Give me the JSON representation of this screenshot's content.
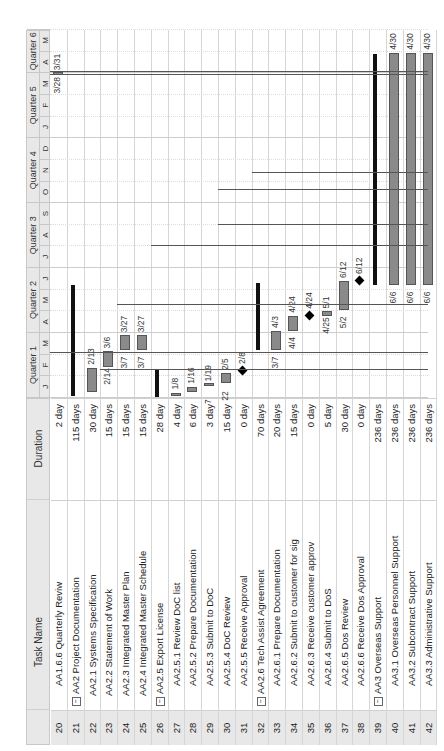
{
  "columns": {
    "id": "",
    "name": "Task Name",
    "duration": "Duration"
  },
  "timescale": {
    "quarters": [
      "Quarter 1",
      "Quarter 2",
      "Quarter 3",
      "Quarter 4",
      "Quarter 5",
      "Quarter 6"
    ],
    "months": [
      "J",
      "F",
      "M",
      "A",
      "M",
      "J",
      "J",
      "A",
      "S",
      "O",
      "N",
      "D",
      "J",
      "F",
      "M",
      "A",
      "M"
    ]
  },
  "tasks": [
    {
      "id": "20",
      "name": "AA1.6.6 Quarterly Reviw",
      "duration": "2 day",
      "indent": 2,
      "collapsible": false
    },
    {
      "id": "21",
      "name": "AA2 Project Documentation",
      "duration": "115 days",
      "indent": 0,
      "collapsible": true
    },
    {
      "id": "22",
      "name": "AA2.1 Systems Specification",
      "duration": "30 day",
      "indent": 1,
      "collapsible": false
    },
    {
      "id": "23",
      "name": "AA2.2 Statement of Work",
      "duration": "15 days",
      "indent": 1,
      "collapsible": false
    },
    {
      "id": "24",
      "name": "AA2.3 Integrated Master Plan",
      "duration": "15 days",
      "indent": 1,
      "collapsible": false
    },
    {
      "id": "25",
      "name": "AA2.4 Integrated Master Schedule",
      "duration": "15 days",
      "indent": 1,
      "collapsible": false
    },
    {
      "id": "26",
      "name": "AA2.5 Export License",
      "duration": "28 day",
      "indent": 0,
      "collapsible": true
    },
    {
      "id": "27",
      "name": "AA2.5.1 Review DoC list",
      "duration": "4 day",
      "indent": 2,
      "collapsible": false
    },
    {
      "id": "28",
      "name": "AA2.5.2 Prepare Documentation",
      "duration": "6 day",
      "indent": 2,
      "collapsible": false
    },
    {
      "id": "29",
      "name": "AA2.5.3 Submit to DoC",
      "duration": "3 day",
      "indent": 2,
      "collapsible": false
    },
    {
      "id": "30",
      "name": "AA2.5.4 DoC Review",
      "duration": "15 day",
      "indent": 2,
      "collapsible": false
    },
    {
      "id": "31",
      "name": "AA2.5.5 Receive Approval",
      "duration": "0 day",
      "indent": 2,
      "collapsible": false
    },
    {
      "id": "32",
      "name": "AA2.6 Tech Assist Agreement",
      "duration": "70 days",
      "indent": 0,
      "collapsible": true
    },
    {
      "id": "33",
      "name": "AA2.6.1 Prepare Documentation",
      "duration": "20 days",
      "indent": 2,
      "collapsible": false
    },
    {
      "id": "34",
      "name": "AA2.6.2 Submit to customer for sig",
      "duration": "15 days",
      "indent": 2,
      "collapsible": false
    },
    {
      "id": "35",
      "name": "AA2.6.3 Receive customer approv",
      "duration": "0 day",
      "indent": 2,
      "collapsible": false
    },
    {
      "id": "36",
      "name": "AA2.6.4 Submit to DoS",
      "duration": "5 day",
      "indent": 2,
      "collapsible": false
    },
    {
      "id": "37",
      "name": "AA2.6.5 Dos Review",
      "duration": "30 day",
      "indent": 2,
      "collapsible": false
    },
    {
      "id": "38",
      "name": "AA2.6.6 Receive Dos Approval",
      "duration": "0 day",
      "indent": 2,
      "collapsible": false
    },
    {
      "id": "39",
      "name": "AA3 Overseas Support",
      "duration": "236 days",
      "indent": 0,
      "collapsible": true
    },
    {
      "id": "40",
      "name": "AA3.1 Overseas Personnel Support",
      "duration": "236 days",
      "indent": 2,
      "collapsible": false
    },
    {
      "id": "41",
      "name": "AA3.2 Subcontract Support",
      "duration": "236 days",
      "indent": 2,
      "collapsible": false
    },
    {
      "id": "42",
      "name": "AA3.3 Administrative Support",
      "duration": "236 days",
      "indent": 2,
      "collapsible": false
    }
  ],
  "chart_data": {
    "type": "gantt",
    "title": "",
    "orientation": "rotated -90deg",
    "time_axis": {
      "quarters": [
        "Quarter 1",
        "Quarter 2",
        "Quarter 3",
        "Quarter 4",
        "Quarter 5",
        "Quarter 6"
      ],
      "months": [
        "J",
        "F",
        "M",
        "A",
        "M",
        "J",
        "J",
        "A",
        "S",
        "O",
        "N",
        "D",
        "J",
        "F",
        "M",
        "A",
        "M"
      ]
    },
    "bars": [
      {
        "row": "20",
        "type": "task",
        "start_label": "3/28",
        "end_label": "3/31",
        "start_month": 14.9,
        "end_month": 15.0
      },
      {
        "row": "21",
        "type": "summary",
        "start_month": 0.1,
        "end_month": 5.2
      },
      {
        "row": "22",
        "type": "task",
        "start_label": "",
        "end_label": "2/13",
        "start_month": 0.3,
        "end_month": 1.4
      },
      {
        "row": "23",
        "type": "task",
        "start_label": "2/14",
        "end_label": "3/6",
        "start_month": 1.45,
        "end_month": 2.15
      },
      {
        "row": "24",
        "type": "task",
        "start_label": "3/7",
        "end_label": "3/27",
        "start_month": 2.2,
        "end_month": 2.9
      },
      {
        "row": "25",
        "type": "task",
        "start_label": "3/7",
        "end_label": "3/27",
        "start_month": 2.2,
        "end_month": 2.9
      },
      {
        "row": "26",
        "type": "summary",
        "start_month": 0.05,
        "end_month": 1.3
      },
      {
        "row": "27",
        "type": "task",
        "start_label": "",
        "end_label": "1/8",
        "start_month": 0.1,
        "end_month": 0.25
      },
      {
        "row": "28",
        "type": "task",
        "start_label": "",
        "end_label": "1/16",
        "start_month": 0.3,
        "end_month": 0.52
      },
      {
        "row": "29",
        "type": "task",
        "start_label": "7",
        "end_label": "1/19",
        "start_month": 0.55,
        "end_month": 0.62
      },
      {
        "row": "30",
        "type": "task",
        "start_label": "22",
        "end_label": "2/5",
        "start_month": 0.7,
        "end_month": 1.15
      },
      {
        "row": "31",
        "type": "milestone",
        "label": "2/8",
        "at_month": 1.25
      },
      {
        "row": "32",
        "type": "summary",
        "start_month": 2.2,
        "end_month": 5.3
      },
      {
        "row": "33",
        "type": "task",
        "start_label": "3/7",
        "end_label": "4/3",
        "start_month": 2.2,
        "end_month": 3.1
      },
      {
        "row": "34",
        "type": "task",
        "start_label": "4/4",
        "end_label": "4/24",
        "start_month": 3.1,
        "end_month": 3.8
      },
      {
        "row": "35",
        "type": "milestone",
        "label": "4/24",
        "at_month": 3.8
      },
      {
        "row": "36",
        "type": "task",
        "start_label": "4/25",
        "end_label": "5/1",
        "start_month": 3.8,
        "end_month": 4.0
      },
      {
        "row": "37",
        "type": "task",
        "start_label": "5/2",
        "end_label": "6/12",
        "start_month": 4.05,
        "end_month": 5.4
      },
      {
        "row": "38",
        "type": "milestone",
        "label": "6/12",
        "at_month": 5.4
      },
      {
        "row": "39",
        "type": "summary",
        "start_month": 5.2,
        "end_month": 15.9
      },
      {
        "row": "40",
        "type": "task",
        "start_label": "6/6",
        "end_label": "4/30",
        "start_month": 5.2,
        "end_month": 15.95
      },
      {
        "row": "41",
        "type": "task",
        "start_label": "6/6",
        "end_label": "4/30",
        "start_month": 5.2,
        "end_month": 15.95
      },
      {
        "row": "42",
        "type": "task",
        "start_label": "6/6",
        "end_label": "4/30",
        "start_month": 5.2,
        "end_month": 15.95
      }
    ]
  },
  "colors": {
    "bar": "#8a8a8a",
    "summary": "#111111",
    "header": "#e8e8e8",
    "grid": "#d6d6d6"
  }
}
